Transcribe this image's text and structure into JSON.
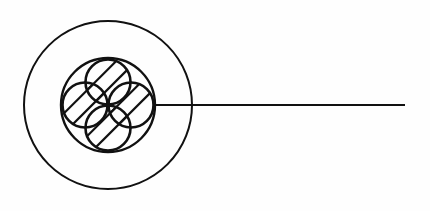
{
  "canvas": {
    "width": 430,
    "height": 211,
    "background_color": "#fefefe",
    "stroke_color": "#111111"
  },
  "diagram": {
    "title": "Cable cross-section schematic",
    "style": {
      "outer_circle_stroke_width": 2,
      "middle_circle_stroke_width": 2.4,
      "conductor_stroke_width": 2.6,
      "hatch_stroke_width": 2.2,
      "leader_stroke_width": 2.2
    },
    "outer_circle": {
      "label": "outer jacket",
      "cx": 108,
      "cy": 105,
      "r": 84
    },
    "middle_circle": {
      "label": "inner sheath",
      "cx": 108,
      "cy": 105,
      "r": 47
    },
    "conductors": [
      {
        "label": "top conductor",
        "cx": 108,
        "cy": 82,
        "r": 22.5
      },
      {
        "label": "left conductor",
        "cx": 85,
        "cy": 105,
        "r": 22.5
      },
      {
        "label": "right conductor",
        "cx": 131,
        "cy": 105,
        "r": 22.5
      },
      {
        "label": "bottom conductor",
        "cx": 108,
        "cy": 128,
        "r": 22.5
      }
    ],
    "hatching": {
      "label": "diagonal hatch fill",
      "angle_degrees": 45,
      "direction": "lower-left to upper-right",
      "lines_per_conductor": 2,
      "offsets": [
        -9,
        5
      ]
    },
    "leader_line": {
      "label": "leader line",
      "x1": 155,
      "y1": 105,
      "x2": 405,
      "y2": 105
    }
  }
}
